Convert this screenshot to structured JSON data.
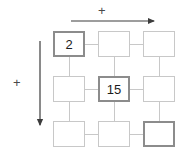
{
  "figure": {
    "type": "grid-diagram",
    "axes": [
      {
        "id": "horizontal-axis",
        "label": "+",
        "direction": "right",
        "orientation": "horizontal"
      },
      {
        "id": "vertical-axis",
        "label": "+",
        "direction": "down",
        "orientation": "vertical"
      }
    ],
    "grid": {
      "rows": 3,
      "columns": 3,
      "cells": [
        {
          "id": "cell-r1c1",
          "row": 1,
          "col": 1,
          "value": "2",
          "highlighted": true
        },
        {
          "id": "cell-r1c2",
          "row": 1,
          "col": 2,
          "value": "",
          "highlighted": false
        },
        {
          "id": "cell-r1c3",
          "row": 1,
          "col": 3,
          "value": "",
          "highlighted": false
        },
        {
          "id": "cell-r2c1",
          "row": 2,
          "col": 1,
          "value": "",
          "highlighted": false
        },
        {
          "id": "cell-r2c2",
          "row": 2,
          "col": 2,
          "value": "15",
          "highlighted": true
        },
        {
          "id": "cell-r2c3",
          "row": 2,
          "col": 3,
          "value": "",
          "highlighted": false
        },
        {
          "id": "cell-r3c1",
          "row": 3,
          "col": 1,
          "value": "",
          "highlighted": false
        },
        {
          "id": "cell-r3c2",
          "row": 3,
          "col": 2,
          "value": "",
          "highlighted": false
        },
        {
          "id": "cell-r3c3",
          "row": 3,
          "col": 3,
          "value": "",
          "highlighted": true
        }
      ]
    },
    "colors": {
      "cell_border": "#c8c8c8",
      "cell_border_highlight": "#8c8c8c",
      "connector": "#c8c8c8",
      "arrow": "#3c3c3c",
      "text": "#1c1c1c",
      "label": "#4a4a4a",
      "background": "#ffffff"
    }
  }
}
